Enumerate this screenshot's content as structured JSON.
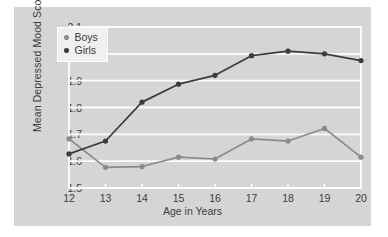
{
  "chart_data": {
    "type": "line",
    "title": "",
    "xlabel": "Age in Years",
    "ylabel": "Mean Depressed Mood Score",
    "x": [
      12,
      13,
      14,
      15,
      16,
      17,
      18,
      19,
      20
    ],
    "xtick_labels": [
      "12",
      "13",
      "14",
      "15",
      "16",
      "17",
      "18",
      "19",
      "20"
    ],
    "ytick_labels": [
      "1.5",
      "1.6",
      "1.7",
      "1.8",
      "1.9",
      "2.0",
      "2.1"
    ],
    "yticks": [
      1.5,
      1.6,
      1.7,
      1.8,
      1.9,
      2.0,
      2.1
    ],
    "ylim": [
      1.5,
      2.1
    ],
    "xlim": [
      12,
      20
    ],
    "grid": "horizontal",
    "legend_position": "upper-left",
    "series": [
      {
        "name": "Boys",
        "color": "#8a8a8a",
        "values": [
          1.683,
          1.577,
          1.58,
          1.615,
          1.608,
          1.683,
          1.675,
          1.722,
          1.615
        ]
      },
      {
        "name": "Girls",
        "color": "#3a3a3a",
        "values": [
          1.627,
          1.675,
          1.82,
          1.887,
          1.92,
          1.993,
          2.01,
          2.0,
          1.975
        ]
      }
    ],
    "colors": {
      "panel_background": "#d6d6d6",
      "gridline": "#ffffff",
      "axis_text": "#3b3b3b",
      "legend_background": "#f0f0f0"
    }
  },
  "legend": {
    "items": [
      {
        "label": "Boys"
      },
      {
        "label": "Girls"
      }
    ]
  }
}
